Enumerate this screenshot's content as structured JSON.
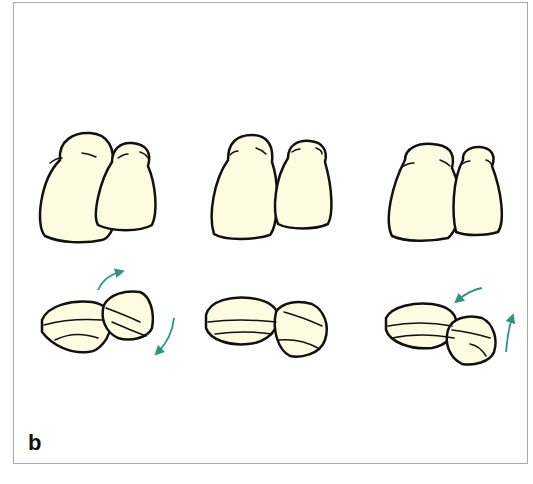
{
  "figure": {
    "panel_label": "b",
    "colors": {
      "tooth_fill": "#fdfbe0",
      "outline": "#111111",
      "arrow": "#2a9580",
      "frame_border": "#a9a9a9"
    },
    "groups": [
      {
        "id": "left",
        "description": "incisors front view and occlusal view, rotation arrows clockwise"
      },
      {
        "id": "center",
        "description": "incisors front view and occlusal view, no arrows"
      },
      {
        "id": "right",
        "description": "incisors front view and occlusal view, rotation arrows counter-clockwise"
      }
    ]
  }
}
